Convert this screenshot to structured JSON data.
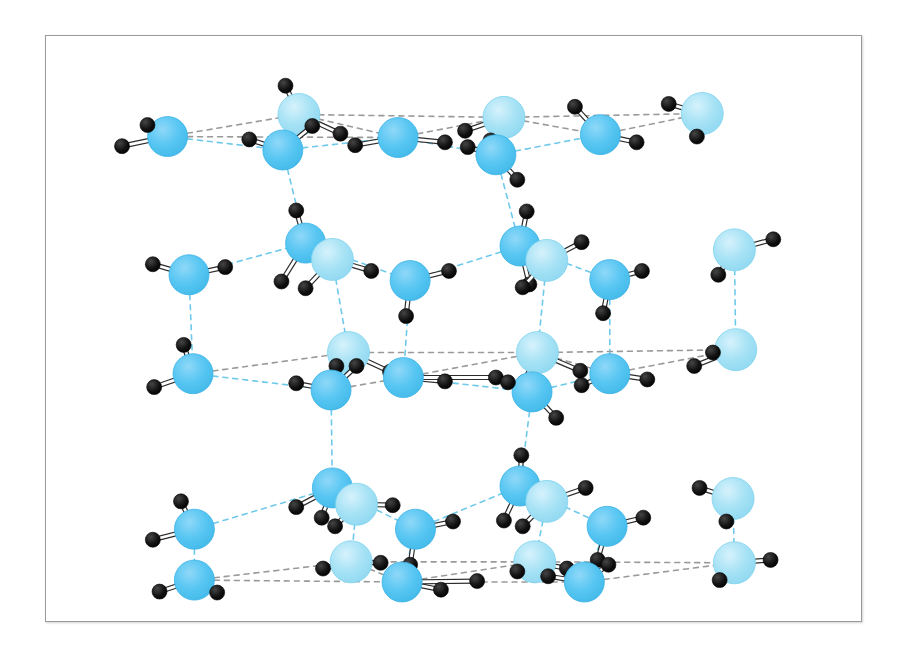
{
  "figure": {
    "domain": "Diagram",
    "title": "",
    "caption": "",
    "background_color": "#ffffff",
    "frame": {
      "x": 45,
      "y": 35,
      "width": 817,
      "height": 587,
      "border_color": "#9a9a9a",
      "border_width": 1,
      "fill": "#ffffff"
    }
  },
  "legend": {
    "oxygen_label": "O",
    "hydrogen_label": "H",
    "covalent_bond_label": "covalent bond",
    "hydrogen_bond_label": "hydrogen bond"
  },
  "style": {
    "oxygen_light": "#A6E2F5",
    "oxygen_light_edge": "#7FD3EE",
    "oxygen_mid": "#57C6F2",
    "oxygen_mid_edge": "#3BB3E6",
    "hydrogen_color": "#111111",
    "hydrogen_edge": "#000000",
    "covalent_bond_color": "#ffffff",
    "covalent_bond_outline": "#2b2b2b",
    "hbond_color_blue": "#6FC9EA",
    "hbond_color_gray": "#9a9a9a",
    "oxygen_radius_light": 21,
    "oxygen_radius_mid": 20,
    "hydrogen_radius": 7.5,
    "hbond_dash": "5,5",
    "hbond_width": 1.6
  },
  "chart_data": {
    "type": "diagram",
    "name": "hexagonal ice (Ih) crystal structure",
    "layers": [
      {
        "name": "top-layer",
        "y_center": 70
      },
      {
        "name": "middle-layer",
        "y_center": 250
      },
      {
        "name": "bottom-layer",
        "y_center": 450
      }
    ],
    "molecule_count": 36,
    "hydrogen_bond_count": 44,
    "colors_used": [
      "#A6E2F5",
      "#57C6F2",
      "#111111",
      "#ffffff"
    ],
    "molecules": [
      {
        "id": "m01",
        "ox": 37,
        "oy": 86,
        "shade": "mid",
        "h": [
          [
            22,
            74
          ],
          [
            3,
            96
          ]
        ]
      },
      {
        "id": "m02",
        "ox": 135,
        "oy": 63,
        "shade": "light",
        "h": [
          [
            125,
            33
          ],
          [
            166,
            83
          ]
        ]
      },
      {
        "id": "m03",
        "ox": 123,
        "oy": 100,
        "shade": "mid",
        "h": [
          [
            98,
            89
          ],
          [
            145,
            75
          ]
        ]
      },
      {
        "id": "m04",
        "ox": 209,
        "oy": 87,
        "shade": "mid",
        "h": [
          [
            177,
            95
          ],
          [
            244,
            92
          ]
        ]
      },
      {
        "id": "m05",
        "ox": 288,
        "oy": 66,
        "shade": "light",
        "h": [
          [
            259,
            80
          ],
          [
            278,
            90
          ]
        ]
      },
      {
        "id": "m06",
        "ox": 282,
        "oy": 105,
        "shade": "mid",
        "h": [
          [
            261,
            97
          ],
          [
            298,
            131
          ]
        ]
      },
      {
        "id": "m07",
        "ox": 360,
        "oy": 84,
        "shade": "mid",
        "h": [
          [
            341,
            55
          ],
          [
            387,
            92
          ]
        ]
      },
      {
        "id": "m08",
        "ox": 436,
        "oy": 62,
        "shade": "light",
        "h": [
          [
            411,
            52
          ],
          [
            432,
            86
          ]
        ]
      },
      {
        "id": "m09",
        "ox": 53,
        "oy": 230,
        "shade": "mid",
        "h": [
          [
            26,
            219
          ],
          [
            80,
            222
          ]
        ]
      },
      {
        "id": "m10",
        "ox": 140,
        "oy": 197,
        "shade": "mid",
        "h": [
          [
            133,
            163
          ],
          [
            122,
            237
          ]
        ]
      },
      {
        "id": "m11",
        "ox": 160,
        "oy": 214,
        "shade": "light",
        "h": [
          [
            140,
            244
          ],
          [
            189,
            226
          ]
        ]
      },
      {
        "id": "m12",
        "ox": 218,
        "oy": 236,
        "shade": "mid",
        "h": [
          [
            247,
            226
          ],
          [
            215,
            273
          ]
        ]
      },
      {
        "id": "m13",
        "ox": 300,
        "oy": 200,
        "shade": "mid",
        "h": [
          [
            305,
            164
          ],
          [
            307,
            240
          ]
        ]
      },
      {
        "id": "m14",
        "ox": 320,
        "oy": 215,
        "shade": "light",
        "h": [
          [
            346,
            196
          ],
          [
            302,
            243
          ]
        ]
      },
      {
        "id": "m15",
        "ox": 367,
        "oy": 235,
        "shade": "mid",
        "h": [
          [
            391,
            226
          ],
          [
            362,
            270
          ]
        ]
      },
      {
        "id": "m16",
        "ox": 460,
        "oy": 204,
        "shade": "light",
        "h": [
          [
            489,
            193
          ],
          [
            448,
            230
          ]
        ]
      },
      {
        "id": "m17",
        "ox": 56,
        "oy": 333,
        "shade": "mid",
        "h": [
          [
            49,
            303
          ],
          [
            27,
            347
          ]
        ]
      },
      {
        "id": "m18",
        "ox": 172,
        "oy": 311,
        "shade": "light",
        "h": [
          [
            163,
            325
          ],
          [
            203,
            331
          ]
        ]
      },
      {
        "id": "m19",
        "ox": 159,
        "oy": 350,
        "shade": "mid",
        "h": [
          [
            133,
            343
          ],
          [
            178,
            325
          ]
        ]
      },
      {
        "id": "m20",
        "ox": 213,
        "oy": 337,
        "shade": "mid",
        "h": [
          [
            244,
            341
          ],
          [
            282,
            337
          ]
        ]
      },
      {
        "id": "m21",
        "ox": 313,
        "oy": 311,
        "shade": "light",
        "h": [
          [
            303,
            342
          ],
          [
            345,
            330
          ]
        ]
      },
      {
        "id": "m22",
        "ox": 309,
        "oy": 352,
        "shade": "mid",
        "h": [
          [
            291,
            342
          ],
          [
            327,
            379
          ]
        ]
      },
      {
        "id": "m23",
        "ox": 367,
        "oy": 333,
        "shade": "mid",
        "h": [
          [
            346,
            345
          ],
          [
            395,
            339
          ]
        ]
      },
      {
        "id": "m24",
        "ox": 461,
        "oy": 308,
        "shade": "light",
        "h": [
          [
            444,
            311
          ],
          [
            430,
            325
          ]
        ]
      },
      {
        "id": "m25",
        "ox": 57,
        "oy": 495,
        "shade": "mid",
        "h": [
          [
            47,
            466
          ],
          [
            26,
            506
          ]
        ]
      },
      {
        "id": "m26",
        "ox": 160,
        "oy": 452,
        "shade": "mid",
        "h": [
          [
            152,
            483
          ],
          [
            133,
            472
          ]
        ]
      },
      {
        "id": "m27",
        "ox": 178,
        "oy": 469,
        "shade": "light",
        "h": [
          [
            162,
            492
          ],
          [
            205,
            470
          ]
        ]
      },
      {
        "id": "m28",
        "ox": 222,
        "oy": 495,
        "shade": "mid",
        "h": [
          [
            250,
            487
          ],
          [
            218,
            532
          ]
        ]
      },
      {
        "id": "m29",
        "ox": 300,
        "oy": 450,
        "shade": "mid",
        "h": [
          [
            301,
            418
          ],
          [
            288,
            486
          ]
        ]
      },
      {
        "id": "m30",
        "ox": 320,
        "oy": 466,
        "shade": "light",
        "h": [
          [
            349,
            452
          ],
          [
            302,
            492
          ]
        ]
      },
      {
        "id": "m31",
        "ox": 365,
        "oy": 492,
        "shade": "mid",
        "h": [
          [
            392,
            483
          ],
          [
            358,
            527
          ]
        ]
      },
      {
        "id": "m32",
        "ox": 459,
        "oy": 463,
        "shade": "light",
        "h": [
          [
            434,
            452
          ],
          [
            454,
            487
          ]
        ]
      },
      {
        "id": "m33",
        "ox": 57,
        "oy": 548,
        "shade": "mid",
        "h": [
          [
            31,
            560
          ],
          [
            74,
            561
          ]
        ]
      },
      {
        "id": "m34",
        "ox": 174,
        "oy": 529,
        "shade": "light",
        "h": [
          [
            153,
            536
          ],
          [
            196,
            530
          ]
        ]
      },
      {
        "id": "m35",
        "ox": 212,
        "oy": 550,
        "shade": "mid",
        "h": [
          [
            241,
            558
          ],
          [
            268,
            549
          ]
        ]
      },
      {
        "id": "m36",
        "ox": 311,
        "oy": 529,
        "shade": "light",
        "h": [
          [
            298,
            539
          ],
          [
            335,
            536
          ]
        ]
      },
      {
        "id": "m37",
        "ox": 348,
        "oy": 550,
        "shade": "mid",
        "h": [
          [
            321,
            544
          ],
          [
            366,
            532
          ]
        ]
      },
      {
        "id": "m38",
        "ox": 460,
        "oy": 530,
        "shade": "light",
        "h": [
          [
            487,
            527
          ],
          [
            449,
            548
          ]
        ]
      }
    ],
    "hydrogen_bonds": [
      {
        "from": [
          37,
          86
        ],
        "to": [
          135,
          63
        ],
        "color": "gray"
      },
      {
        "from": [
          37,
          86
        ],
        "to": [
          123,
          100
        ],
        "color": "blue"
      },
      {
        "from": [
          135,
          63
        ],
        "to": [
          288,
          66
        ],
        "color": "gray"
      },
      {
        "from": [
          123,
          100
        ],
        "to": [
          209,
          87
        ],
        "color": "gray"
      },
      {
        "from": [
          209,
          87
        ],
        "to": [
          288,
          66
        ],
        "color": "gray"
      },
      {
        "from": [
          209,
          87
        ],
        "to": [
          282,
          105
        ],
        "color": "blue"
      },
      {
        "from": [
          288,
          66
        ],
        "to": [
          436,
          62
        ],
        "color": "gray"
      },
      {
        "from": [
          282,
          105
        ],
        "to": [
          360,
          84
        ],
        "color": "blue"
      },
      {
        "from": [
          360,
          84
        ],
        "to": [
          436,
          62
        ],
        "color": "gray"
      }
    ]
  }
}
